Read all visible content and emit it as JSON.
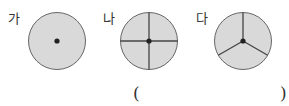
{
  "figures": [
    {
      "label": "가",
      "divisions": 1,
      "description": "circle with center dot, no dividing lines"
    },
    {
      "label": "나",
      "divisions": 4,
      "description": "circle divided into 4 equal parts by two perpendicular diameters"
    },
    {
      "label": "다",
      "divisions": 3,
      "description": "circle divided into 3 equal parts by three radii"
    }
  ],
  "answer": {
    "open_paren": "(",
    "close_paren": ")",
    "value": ""
  },
  "colors": {
    "fill": "#d9d9d9",
    "stroke": "#555555",
    "center": "#222222"
  }
}
